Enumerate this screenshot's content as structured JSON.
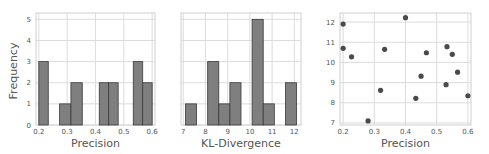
{
  "chart_data": [
    {
      "type": "bar",
      "subtype": "histogram",
      "title": "",
      "xlabel": "Precision",
      "ylabel": "Frequency",
      "xlim": [
        0.19,
        0.61
      ],
      "ylim": [
        0,
        5.3
      ],
      "xticks": [
        "0.2",
        "0.3",
        "0.4",
        "0.5",
        "0.6"
      ],
      "yticks": [
        "0",
        "1",
        "2",
        "3",
        "4",
        "5"
      ],
      "grid": true,
      "bins": [
        {
          "start": 0.2,
          "end": 0.2333,
          "count": 3
        },
        {
          "start": 0.2733,
          "end": 0.3133,
          "count": 1
        },
        {
          "start": 0.3133,
          "end": 0.3533,
          "count": 2
        },
        {
          "start": 0.4133,
          "end": 0.4466,
          "count": 2
        },
        {
          "start": 0.4466,
          "end": 0.48,
          "count": 2
        },
        {
          "start": 0.5333,
          "end": 0.5666,
          "count": 3
        },
        {
          "start": 0.5666,
          "end": 0.6,
          "count": 2
        }
      ]
    },
    {
      "type": "bar",
      "subtype": "histogram",
      "title": "",
      "xlabel": "KL-Divergence",
      "ylabel": "",
      "xlim": [
        6.9,
        12.3
      ],
      "ylim": [
        0,
        5.3
      ],
      "xticks": [
        "7",
        "8",
        "9",
        "10",
        "11",
        "12"
      ],
      "yticks": [
        "0",
        "1",
        "2",
        "3",
        "4",
        "5"
      ],
      "grid": true,
      "bins": [
        {
          "start": 7.1,
          "end": 7.6,
          "count": 1
        },
        {
          "start": 8.1,
          "end": 8.6,
          "count": 3
        },
        {
          "start": 8.6,
          "end": 9.1,
          "count": 1
        },
        {
          "start": 9.1,
          "end": 9.6,
          "count": 2
        },
        {
          "start": 10.1,
          "end": 10.6,
          "count": 5
        },
        {
          "start": 10.6,
          "end": 11.1,
          "count": 1
        },
        {
          "start": 11.6,
          "end": 12.1,
          "count": 2
        }
      ]
    },
    {
      "type": "scatter",
      "title": "",
      "xlabel": "Precision",
      "ylabel": "KL-Divergence",
      "xlim": [
        0.19,
        0.61
      ],
      "ylim": [
        6.9,
        12.45
      ],
      "xticks": [
        "0.2",
        "0.3",
        "0.4",
        "0.5",
        "0.6"
      ],
      "yticks": [
        "7",
        "8",
        "9",
        "10",
        "11",
        "12"
      ],
      "grid": true,
      "points": [
        {
          "x": 0.2,
          "y": 11.9
        },
        {
          "x": 0.2,
          "y": 10.7
        },
        {
          "x": 0.227,
          "y": 10.28
        },
        {
          "x": 0.28,
          "y": 7.1
        },
        {
          "x": 0.32,
          "y": 8.62
        },
        {
          "x": 0.333,
          "y": 10.65
        },
        {
          "x": 0.4,
          "y": 12.22
        },
        {
          "x": 0.433,
          "y": 8.22
        },
        {
          "x": 0.45,
          "y": 9.32
        },
        {
          "x": 0.467,
          "y": 10.48
        },
        {
          "x": 0.53,
          "y": 8.9
        },
        {
          "x": 0.533,
          "y": 10.78
        },
        {
          "x": 0.55,
          "y": 10.4
        },
        {
          "x": 0.567,
          "y": 9.52
        },
        {
          "x": 0.6,
          "y": 8.35
        }
      ]
    }
  ],
  "style": {
    "bar_color": "#7f7f7f",
    "bar_edge": "#3a3a3a",
    "point_color": "#4a4a4a",
    "grid_color": "#dcdcdc",
    "frame_color": "#cfcfcf",
    "tick_color": "#555555",
    "label_color": "#555555"
  }
}
